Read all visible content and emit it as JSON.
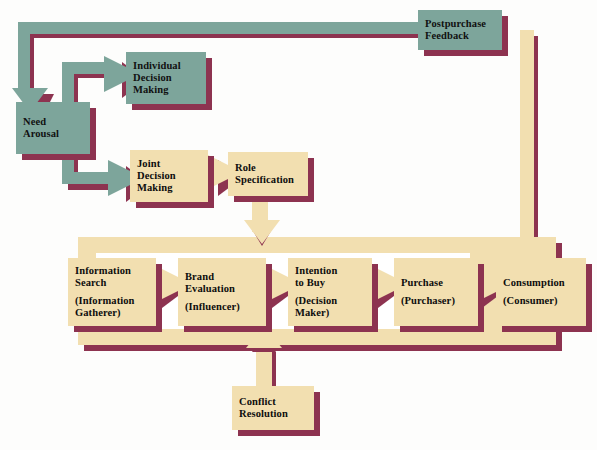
{
  "diagram": {
    "colors": {
      "teal": "#7da59b",
      "cream": "#f2dfb0",
      "shadow": "#8d3350",
      "background": "#fdfdfc",
      "text": "#0d0d0d"
    },
    "nodes": [
      {
        "id": "need-arousal",
        "lines": [
          "Need",
          "Arousal"
        ],
        "fill": "teal",
        "x": 16,
        "y": 102,
        "w": 74,
        "h": 52
      },
      {
        "id": "individual-decision-making",
        "lines": [
          "Individual",
          "Decision",
          "Making"
        ],
        "fill": "teal",
        "x": 126,
        "y": 52,
        "w": 80,
        "h": 52
      },
      {
        "id": "joint-decision-making",
        "lines": [
          "Joint",
          "Decision",
          "Making"
        ],
        "fill": "cream",
        "x": 130,
        "y": 150,
        "w": 78,
        "h": 52
      },
      {
        "id": "role-specification",
        "lines": [
          "Role",
          "Specification"
        ],
        "fill": "cream",
        "x": 228,
        "y": 152,
        "w": 80,
        "h": 44
      },
      {
        "id": "postpurchase-feedback",
        "lines": [
          "Postpurchase",
          "Feedback"
        ],
        "fill": "teal",
        "x": 418,
        "y": 10,
        "w": 84,
        "h": 40
      },
      {
        "id": "information-search",
        "lines": [
          "Information",
          "Search"
        ],
        "sublines": [
          "(Information",
          "Gatherer)"
        ],
        "fill": "cream",
        "x": 68,
        "y": 258,
        "w": 88,
        "h": 68
      },
      {
        "id": "brand-evaluation",
        "lines": [
          "Brand",
          "Evaluation"
        ],
        "sublines": [
          "(Influencer)"
        ],
        "fill": "cream",
        "x": 178,
        "y": 258,
        "w": 88,
        "h": 68
      },
      {
        "id": "intention-to-buy",
        "lines": [
          "Intention",
          "to Buy"
        ],
        "sublines": [
          "(Decision",
          "Maker)"
        ],
        "fill": "cream",
        "x": 288,
        "y": 258,
        "w": 84,
        "h": 68
      },
      {
        "id": "purchase",
        "lines": [
          "Purchase"
        ],
        "sublines": [
          "(Purchaser)"
        ],
        "fill": "cream",
        "x": 394,
        "y": 258,
        "w": 84,
        "h": 68
      },
      {
        "id": "consumption",
        "lines": [
          "Consumption"
        ],
        "sublines": [
          "(Consumer)"
        ],
        "fill": "cream",
        "x": 496,
        "y": 258,
        "w": 90,
        "h": 68
      },
      {
        "id": "conflict-resolution",
        "lines": [
          "Conflict",
          "Resolution"
        ],
        "fill": "cream",
        "x": 232,
        "y": 386,
        "w": 82,
        "h": 44
      }
    ],
    "flows": [
      {
        "id": "feedback-to-need-arousal",
        "from": "postpurchase-feedback",
        "to": "need-arousal",
        "color": "teal"
      },
      {
        "id": "need-to-individual",
        "from": "need-arousal",
        "to": "individual-decision-making",
        "color": "teal"
      },
      {
        "id": "need-to-joint",
        "from": "need-arousal",
        "to": "joint-decision-making",
        "color": "teal"
      },
      {
        "id": "joint-to-role",
        "from": "joint-decision-making",
        "to": "role-specification",
        "color": "cream"
      },
      {
        "id": "role-to-process-band",
        "from": "role-specification",
        "to": "information-search",
        "color": "cream"
      },
      {
        "id": "search-to-brand",
        "from": "information-search",
        "to": "brand-evaluation",
        "color": "cream"
      },
      {
        "id": "brand-to-intention",
        "from": "brand-evaluation",
        "to": "intention-to-buy",
        "color": "cream"
      },
      {
        "id": "intention-to-purchase",
        "from": "intention-to-buy",
        "to": "purchase",
        "color": "cream"
      },
      {
        "id": "purchase-to-consumption",
        "from": "purchase",
        "to": "consumption",
        "color": "cream"
      },
      {
        "id": "consumption-to-feedback",
        "from": "consumption",
        "to": "postpurchase-feedback",
        "color": "cream"
      },
      {
        "id": "conflict-into-band",
        "from": "conflict-resolution",
        "to": "information-search",
        "color": "cream"
      }
    ]
  }
}
